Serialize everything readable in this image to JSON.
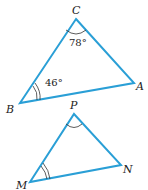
{
  "colors": {
    "line": "#2a9fd6",
    "arc": "#333333",
    "text": "#222222"
  },
  "triangles": [
    {
      "name": "CBA",
      "vertices": {
        "C": {
          "label": "C",
          "x": 76,
          "y": 19
        },
        "A": {
          "label": "A",
          "x": 134,
          "y": 83
        },
        "B": {
          "label": "B",
          "x": 20,
          "y": 103
        }
      },
      "angles": {
        "C": "78°",
        "B": "46°"
      }
    },
    {
      "name": "PMN",
      "vertices": {
        "P": {
          "label": "P",
          "x": 74,
          "y": 114
        },
        "N": {
          "label": "N",
          "x": 121,
          "y": 165
        },
        "M": {
          "label": "M",
          "x": 30,
          "y": 182
        }
      }
    }
  ]
}
